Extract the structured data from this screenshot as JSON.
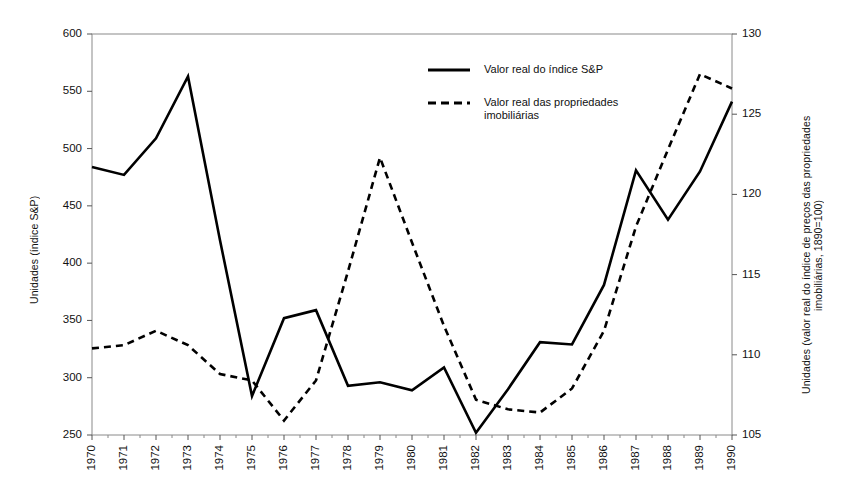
{
  "chart_data": {
    "type": "line",
    "title": "",
    "xlabel": "",
    "ylabel": "Unidades (índice S&P)",
    "ylabel_right": "Unidades (valor real do índice de preços das propriedades imobiliárias, 1890=100)",
    "grid": false,
    "legend_position": "top-center",
    "x": [
      1970,
      1971,
      1972,
      1973,
      1974,
      1975,
      1976,
      1977,
      1978,
      1979,
      1980,
      1981,
      1982,
      1983,
      1984,
      1985,
      1986,
      1987,
      1988,
      1989,
      1990
    ],
    "xtick_labels": [
      "1970",
      "1971",
      "1972",
      "1973",
      "1974",
      "1975",
      "1976",
      "1977",
      "1978",
      "1979",
      "1980",
      "1981",
      "1982",
      "1983",
      "1984",
      "1985",
      "1986",
      "1987",
      "1988",
      "1989",
      "1990"
    ],
    "ylim": [
      250,
      600
    ],
    "ytick_labels": [
      "250",
      "300",
      "350",
      "400",
      "450",
      "500",
      "550",
      "600"
    ],
    "ytick_values": [
      250,
      300,
      350,
      400,
      450,
      500,
      550,
      600
    ],
    "ylim_right": [
      105,
      130
    ],
    "ytick_labels_right": [
      "105",
      "110",
      "115",
      "120",
      "125",
      "130"
    ],
    "ytick_values_right": [
      105,
      110,
      115,
      120,
      125,
      130
    ],
    "series": [
      {
        "name": "Valor real do índice S&P",
        "axis": "left",
        "style": "solid",
        "color": "#000000",
        "values": [
          484,
          477,
          509,
          563,
          420,
          284,
          352,
          359,
          293,
          296,
          289,
          309,
          252,
          290,
          331,
          329,
          381,
          481,
          438,
          480,
          541
        ]
      },
      {
        "name": "Valor real das propriedades imobiliárias",
        "axis": "right",
        "style": "dashed",
        "color": "#000000",
        "values": [
          110.4,
          110.6,
          111.5,
          110.6,
          108.8,
          108.4,
          105.9,
          108.4,
          115.2,
          122.3,
          117.0,
          111.8,
          107.2,
          106.6,
          106.4,
          107.9,
          111.5,
          118.0,
          122.8,
          127.5,
          126.6
        ]
      }
    ]
  },
  "legend": {
    "items": [
      {
        "label": "Valor real do índice S&P",
        "style": "solid"
      },
      {
        "label": "Valor real das propriedades\nimobiliárias",
        "style": "dashed"
      }
    ]
  }
}
